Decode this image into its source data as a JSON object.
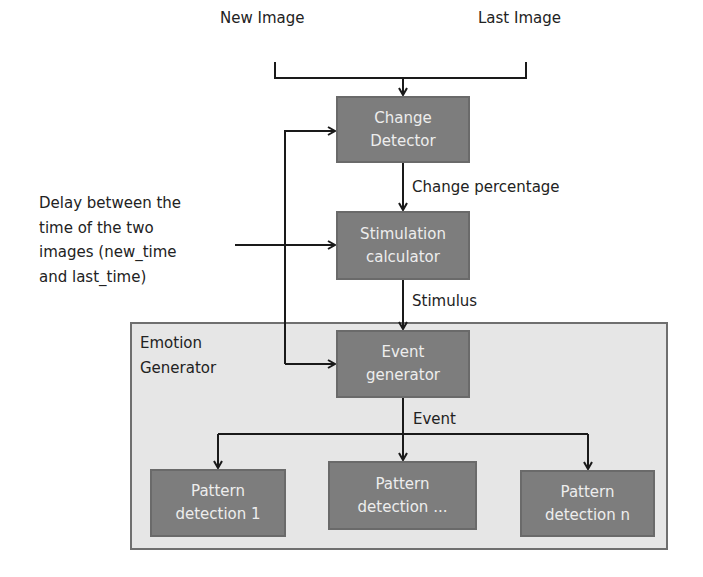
{
  "diagram": {
    "inputs": {
      "new_image": "New Image",
      "last_image": "Last Image"
    },
    "delay_label": {
      "line1": "Delay between the",
      "line2": "time of the two",
      "line3": "images  (new_time",
      "line4": "and last_time)"
    },
    "nodes": {
      "change_detector": {
        "line1": "Change",
        "line2": "Detector"
      },
      "stimulation_calculator": {
        "line1": "Stimulation",
        "line2": "calculator"
      },
      "event_generator": {
        "line1": "Event",
        "line2": "generator"
      },
      "pattern_1": {
        "line1": "Pattern",
        "line2": "detection 1"
      },
      "pattern_mid": {
        "line1": "Pattern",
        "line2": "detection ..."
      },
      "pattern_n": {
        "line1": "Pattern",
        "line2": "detection n"
      }
    },
    "edge_labels": {
      "change_percentage": "Change percentage",
      "stimulus": "Stimulus",
      "event": "Event"
    },
    "group": {
      "line1": "Emotion",
      "line2": "Generator"
    },
    "colors": {
      "node_fill": "#7d7d7d",
      "node_text": "#ededed",
      "group_fill": "#e6e6e6",
      "group_border": "#6f6f6f",
      "line": "#1a1a1a"
    }
  }
}
